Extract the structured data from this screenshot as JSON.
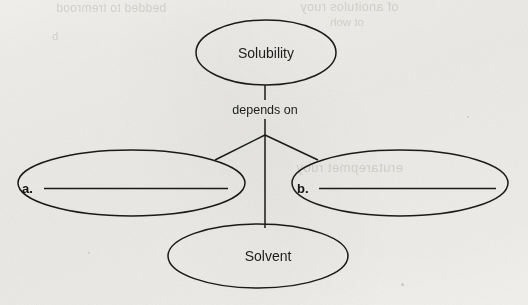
{
  "document": {
    "type": "concept-map-worksheet",
    "background_color": "#f2f1ee",
    "ink_color": "#1a1a1a"
  },
  "diagram": {
    "type": "concept-map",
    "root": {
      "id": "solubility",
      "label": "Solubility",
      "shape": "ellipse"
    },
    "relation_label": "depends on",
    "children": [
      {
        "id": "blank-a",
        "letter": "a.",
        "label": "",
        "shape": "ellipse",
        "is_blank": true
      },
      {
        "id": "solvent",
        "letter": "",
        "label": "Solvent",
        "shape": "ellipse",
        "is_blank": false
      },
      {
        "id": "blank-b",
        "letter": "b.",
        "label": "",
        "shape": "ellipse",
        "is_blank": true
      }
    ]
  },
  "bleed_through": {
    "line_1": "bedded to tremrood",
    "line_2": "of anoitulos ruoy",
    "line_3": "ot woh",
    "line_4": "b",
    "line_5": "erutarepmet ruoy"
  }
}
